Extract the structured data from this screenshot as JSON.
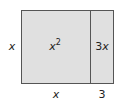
{
  "diagram": {
    "type": "area-model",
    "regions": [
      {
        "id": "square",
        "label_var": "x",
        "label_exp": "2",
        "width_label": "x",
        "height_label": "x"
      },
      {
        "id": "strip",
        "label_coef": "3",
        "label_var": "x",
        "width_label": "3",
        "height_label": "x"
      }
    ],
    "labels": {
      "left": "x",
      "bottom_left": "x",
      "bottom_right": "3",
      "region_square_base": "x",
      "region_square_exp": "2",
      "region_strip_coef": "3",
      "region_strip_var": "x"
    },
    "colors": {
      "fill": "#e0e0e0",
      "stroke": "#555555",
      "text": "#222222"
    }
  }
}
